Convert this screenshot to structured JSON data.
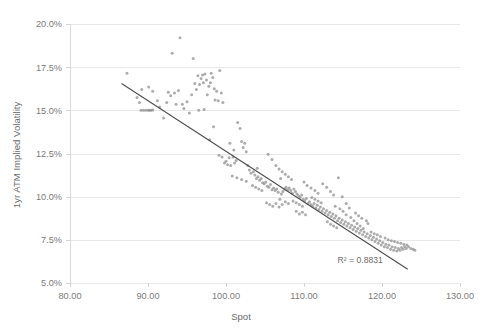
{
  "chart_data": {
    "type": "scatter",
    "title": "",
    "xlabel": "Spot",
    "ylabel": "1yr ATM Implied Volatility",
    "xlim": [
      80,
      130
    ],
    "ylim": [
      5.0,
      20.0
    ],
    "xticks": [
      "80.00",
      "90.00",
      "100.00",
      "110.00",
      "120.00",
      "130.00"
    ],
    "xtick_values": [
      80,
      90,
      100,
      110,
      120,
      130
    ],
    "yticks": [
      "5.0%",
      "7.5%",
      "10.0%",
      "12.5%",
      "15.0%",
      "17.5%",
      "20.0%"
    ],
    "ytick_values": [
      5.0,
      7.5,
      10.0,
      12.5,
      15.0,
      17.5,
      20.0
    ],
    "grid": true,
    "legend": null,
    "annotations": [
      {
        "name": "r-squared",
        "text": "R² = 0.8831",
        "x": 117.2,
        "y": 6.15
      }
    ],
    "trendline": {
      "name": "linear-fit",
      "x0": 86.6,
      "y0": 16.55,
      "x1": 123.3,
      "y1": 5.8,
      "r_squared": 0.8831,
      "color": "#4d4d4d"
    },
    "point_color": "#8c8c8c",
    "point_size": 1.5,
    "series": [
      {
        "name": "spot-vs-implied-vol",
        "points": [
          [
            87.3,
            17.15
          ],
          [
            88.6,
            15.75
          ],
          [
            88.9,
            15.45
          ],
          [
            89.1,
            15.0
          ],
          [
            89.4,
            15.0
          ],
          [
            89.7,
            15.0
          ],
          [
            90.0,
            15.0
          ],
          [
            90.2,
            15.0
          ],
          [
            90.4,
            15.0
          ],
          [
            90.6,
            15.02
          ],
          [
            89.2,
            16.2
          ],
          [
            90.1,
            16.35
          ],
          [
            90.6,
            16.1
          ],
          [
            91.2,
            15.55
          ],
          [
            91.5,
            15.2
          ],
          [
            92.0,
            14.55
          ],
          [
            92.4,
            15.45
          ],
          [
            92.6,
            16.05
          ],
          [
            92.9,
            15.85
          ],
          [
            93.1,
            18.3
          ],
          [
            93.4,
            16.0
          ],
          [
            93.6,
            15.35
          ],
          [
            93.9,
            16.15
          ],
          [
            94.1,
            19.2
          ],
          [
            94.4,
            15.35
          ],
          [
            94.6,
            15.1
          ],
          [
            95.0,
            15.5
          ],
          [
            95.3,
            14.85
          ],
          [
            95.6,
            15.9
          ],
          [
            95.8,
            18.0
          ],
          [
            96.0,
            16.55
          ],
          [
            96.2,
            16.2
          ],
          [
            96.4,
            17.0
          ],
          [
            96.6,
            16.5
          ],
          [
            96.8,
            16.85
          ],
          [
            97.0,
            17.05
          ],
          [
            97.1,
            16.6
          ],
          [
            97.3,
            17.1
          ],
          [
            97.5,
            16.75
          ],
          [
            97.6,
            15.9
          ],
          [
            97.8,
            16.4
          ],
          [
            98.0,
            16.6
          ],
          [
            98.1,
            17.15
          ],
          [
            98.3,
            16.9
          ],
          [
            98.5,
            16.25
          ],
          [
            98.6,
            15.6
          ],
          [
            98.8,
            16.1
          ],
          [
            99.0,
            15.55
          ],
          [
            99.2,
            17.3
          ],
          [
            99.4,
            16.0
          ],
          [
            99.6,
            15.45
          ],
          [
            97.2,
            15.05
          ],
          [
            97.9,
            13.3
          ],
          [
            98.4,
            14.05
          ],
          [
            99.1,
            12.4
          ],
          [
            99.5,
            12.3
          ],
          [
            99.8,
            11.95
          ],
          [
            100.0,
            12.05
          ],
          [
            100.2,
            11.85
          ],
          [
            100.4,
            12.25
          ],
          [
            100.6,
            11.8
          ],
          [
            100.9,
            12.3
          ],
          [
            101.1,
            11.95
          ],
          [
            101.3,
            12.1
          ],
          [
            101.5,
            14.3
          ],
          [
            101.8,
            13.95
          ],
          [
            102.0,
            13.2
          ],
          [
            102.2,
            12.85
          ],
          [
            102.4,
            13.1
          ],
          [
            102.6,
            12.6
          ],
          [
            102.8,
            11.8
          ],
          [
            103.0,
            11.55
          ],
          [
            103.2,
            11.35
          ],
          [
            103.5,
            11.45
          ],
          [
            103.7,
            11.25
          ],
          [
            103.9,
            11.05
          ],
          [
            104.1,
            11.15
          ],
          [
            104.3,
            10.95
          ],
          [
            104.5,
            11.05
          ],
          [
            104.7,
            10.8
          ],
          [
            104.9,
            10.75
          ],
          [
            105.1,
            10.85
          ],
          [
            105.3,
            10.6
          ],
          [
            105.5,
            10.55
          ],
          [
            105.7,
            10.7
          ],
          [
            105.9,
            10.4
          ],
          [
            106.1,
            10.5
          ],
          [
            106.3,
            10.35
          ],
          [
            106.5,
            10.45
          ],
          [
            106.7,
            10.25
          ],
          [
            106.9,
            9.85
          ],
          [
            107.1,
            10.15
          ],
          [
            107.3,
            10.3
          ],
          [
            107.5,
            10.45
          ],
          [
            107.7,
            10.55
          ],
          [
            107.9,
            10.4
          ],
          [
            108.1,
            10.5
          ],
          [
            108.3,
            10.35
          ],
          [
            108.5,
            10.2
          ],
          [
            108.7,
            10.45
          ],
          [
            108.9,
            10.3
          ],
          [
            109.1,
            10.15
          ],
          [
            109.3,
            10.05
          ],
          [
            109.5,
            9.95
          ],
          [
            109.7,
            10.1
          ],
          [
            109.9,
            9.85
          ],
          [
            110.1,
            9.75
          ],
          [
            110.3,
            9.9
          ],
          [
            110.5,
            9.6
          ],
          [
            110.7,
            9.7
          ],
          [
            110.9,
            9.55
          ],
          [
            111.1,
            9.45
          ],
          [
            111.3,
            9.6
          ],
          [
            111.5,
            9.35
          ],
          [
            111.7,
            9.5
          ],
          [
            111.9,
            9.25
          ],
          [
            112.1,
            9.4
          ],
          [
            112.3,
            9.15
          ],
          [
            112.5,
            9.3
          ],
          [
            112.7,
            9.05
          ],
          [
            112.9,
            9.2
          ],
          [
            113.1,
            8.95
          ],
          [
            113.3,
            9.1
          ],
          [
            113.5,
            8.85
          ],
          [
            113.7,
            9.0
          ],
          [
            113.9,
            8.75
          ],
          [
            114.1,
            8.9
          ],
          [
            114.3,
            8.6
          ],
          [
            114.5,
            8.75
          ],
          [
            114.7,
            8.5
          ],
          [
            114.9,
            8.65
          ],
          [
            115.1,
            8.4
          ],
          [
            115.3,
            8.55
          ],
          [
            115.5,
            8.3
          ],
          [
            115.7,
            8.45
          ],
          [
            115.9,
            8.2
          ],
          [
            116.1,
            8.35
          ],
          [
            116.3,
            8.1
          ],
          [
            116.5,
            8.25
          ],
          [
            116.7,
            8.0
          ],
          [
            116.9,
            8.15
          ],
          [
            117.1,
            7.9
          ],
          [
            117.3,
            8.05
          ],
          [
            117.5,
            7.8
          ],
          [
            117.7,
            7.95
          ],
          [
            117.9,
            7.7
          ],
          [
            118.1,
            7.85
          ],
          [
            118.3,
            7.6
          ],
          [
            118.5,
            7.75
          ],
          [
            118.7,
            7.5
          ],
          [
            118.9,
            7.65
          ],
          [
            119.1,
            7.4
          ],
          [
            119.3,
            7.55
          ],
          [
            119.5,
            7.3
          ],
          [
            119.7,
            7.45
          ],
          [
            119.9,
            7.2
          ],
          [
            120.1,
            7.35
          ],
          [
            120.3,
            7.1
          ],
          [
            120.5,
            7.25
          ],
          [
            120.7,
            7.05
          ],
          [
            120.9,
            7.2
          ],
          [
            121.1,
            6.95
          ],
          [
            121.3,
            7.1
          ],
          [
            121.5,
            6.9
          ],
          [
            121.7,
            7.05
          ],
          [
            121.9,
            6.85
          ],
          [
            122.1,
            7.0
          ],
          [
            122.3,
            6.9
          ],
          [
            122.5,
            7.05
          ],
          [
            122.7,
            6.95
          ],
          [
            122.9,
            7.1
          ],
          [
            123.1,
            7.0
          ],
          [
            123.4,
            7.1
          ],
          [
            123.7,
            7.0
          ],
          [
            124.0,
            6.95
          ],
          [
            124.2,
            6.9
          ],
          [
            105.4,
            12.45
          ],
          [
            105.9,
            12.15
          ],
          [
            106.4,
            11.8
          ],
          [
            106.8,
            11.6
          ],
          [
            107.2,
            11.45
          ],
          [
            107.6,
            11.3
          ],
          [
            108.0,
            11.15
          ],
          [
            108.4,
            11.0
          ],
          [
            105.2,
            9.65
          ],
          [
            105.6,
            9.55
          ],
          [
            106.0,
            9.45
          ],
          [
            106.4,
            9.6
          ],
          [
            106.8,
            9.4
          ],
          [
            107.2,
            9.55
          ],
          [
            107.6,
            9.7
          ],
          [
            108.0,
            9.6
          ],
          [
            112.4,
            10.75
          ],
          [
            112.9,
            10.55
          ],
          [
            113.4,
            10.3
          ],
          [
            113.8,
            10.1
          ],
          [
            114.4,
            11.1
          ],
          [
            114.9,
            10.0
          ],
          [
            115.4,
            9.6
          ],
          [
            115.8,
            9.35
          ],
          [
            113.0,
            8.55
          ],
          [
            113.4,
            8.4
          ],
          [
            113.8,
            8.3
          ],
          [
            114.2,
            8.2
          ],
          [
            114.6,
            9.3
          ],
          [
            115.0,
            9.15
          ],
          [
            115.4,
            8.95
          ],
          [
            116.0,
            8.8
          ],
          [
            116.4,
            8.6
          ],
          [
            116.8,
            8.45
          ],
          [
            117.2,
            8.3
          ],
          [
            117.6,
            8.15
          ],
          [
            110.4,
            10.65
          ],
          [
            110.9,
            10.5
          ],
          [
            111.4,
            10.35
          ],
          [
            111.8,
            10.2
          ],
          [
            109.0,
            9.15
          ],
          [
            109.4,
            9.0
          ],
          [
            109.8,
            9.1
          ],
          [
            110.2,
            8.95
          ],
          [
            100.8,
            11.2
          ],
          [
            101.4,
            11.1
          ],
          [
            102.0,
            11.0
          ],
          [
            102.6,
            10.9
          ],
          [
            118.6,
            7.95
          ],
          [
            119.0,
            7.85
          ],
          [
            119.4,
            7.8
          ],
          [
            119.8,
            7.7
          ],
          [
            120.4,
            7.6
          ],
          [
            120.8,
            7.5
          ],
          [
            121.2,
            7.45
          ],
          [
            121.6,
            7.4
          ],
          [
            122.0,
            7.35
          ],
          [
            122.4,
            7.3
          ],
          [
            122.8,
            7.25
          ],
          [
            123.2,
            7.2
          ],
          [
            103.4,
            10.65
          ],
          [
            103.8,
            10.55
          ],
          [
            104.2,
            10.45
          ],
          [
            104.6,
            10.35
          ],
          [
            108.6,
            9.75
          ],
          [
            109.0,
            9.65
          ],
          [
            109.4,
            9.55
          ],
          [
            109.8,
            9.45
          ],
          [
            111.0,
            9.95
          ],
          [
            111.4,
            9.85
          ],
          [
            111.8,
            9.75
          ],
          [
            112.2,
            9.65
          ],
          [
            116.6,
            9.05
          ],
          [
            117.0,
            8.9
          ],
          [
            117.4,
            8.75
          ],
          [
            118.0,
            8.6
          ],
          [
            96.5,
            15.0
          ],
          [
            100.5,
            13.1
          ],
          [
            101.0,
            12.7
          ],
          [
            104.0,
            11.65
          ],
          [
            107.0,
            11.05
          ],
          [
            110.0,
            10.85
          ],
          [
            114.0,
            9.45
          ],
          [
            118.2,
            8.45
          ]
        ]
      }
    ]
  },
  "axis": {
    "x_title": "Spot",
    "y_title": "1yr ATM Implied Volatility"
  }
}
